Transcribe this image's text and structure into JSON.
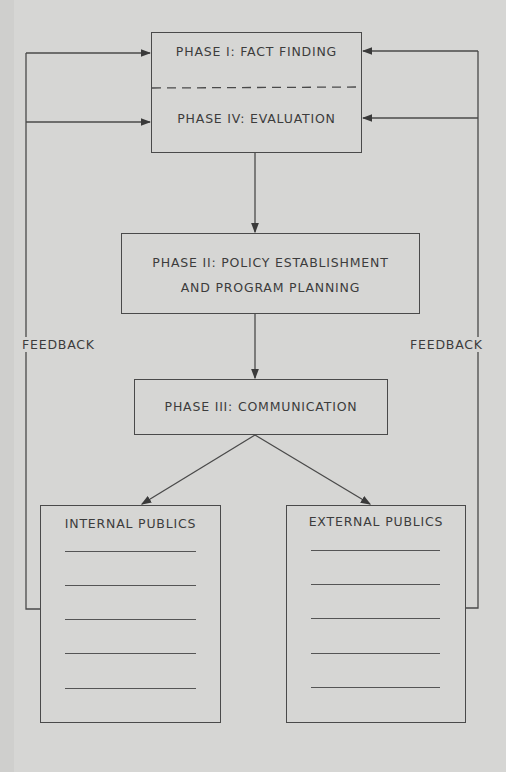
{
  "diagram": {
    "phase1": {
      "label": "PHASE I: FACT FINDING"
    },
    "phase4": {
      "label": "PHASE IV: EVALUATION"
    },
    "phase2": {
      "line1": "PHASE II: POLICY ESTABLISHMENT",
      "line2": "AND PROGRAM PLANNING"
    },
    "phase3": {
      "label": "PHASE III: COMMUNICATION"
    },
    "internal_publics": {
      "label": "INTERNAL PUBLICS",
      "blank_lines": 5
    },
    "external_publics": {
      "label": "EXTERNAL PUBLICS",
      "blank_lines": 5
    },
    "feedback_left": {
      "label": "FEEDBACK"
    },
    "feedback_right": {
      "label": "FEEDBACK"
    },
    "colors": {
      "background": "#d6d6d4",
      "line": "#4a4a4a",
      "text": "#3c3c3c"
    }
  }
}
